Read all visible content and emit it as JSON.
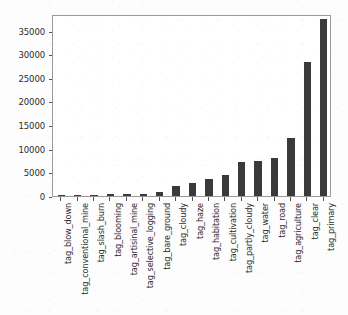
{
  "chart_data": {
    "type": "bar",
    "title": "",
    "xlabel": "",
    "ylabel": "",
    "grid": false,
    "legend": false,
    "bar_color": "#3a3a3a",
    "axis_color": "#9a9a9a",
    "ylim": [
      0,
      38500
    ],
    "yticks": [
      0,
      5000,
      10000,
      15000,
      20000,
      25000,
      30000,
      35000
    ],
    "ytick_labels": [
      "0",
      "5000",
      "10000",
      "15000",
      "20000",
      "25000",
      "30000",
      "35000"
    ],
    "categories": [
      "tag_blow_down",
      "tag_conventional_mine",
      "tag_slash_burn",
      "tag_blooming",
      "tag_artisinal_mine",
      "tag_selective_logging",
      "tag_bare_ground",
      "tag_cloudy",
      "tag_haze",
      "tag_habitation",
      "tag_cultivation",
      "tag_partly_cloudy",
      "tag_water",
      "tag_road",
      "tag_agriculture",
      "tag_clear",
      "tag_primary"
    ],
    "values": [
      98,
      100,
      209,
      332,
      339,
      340,
      862,
      2089,
      2697,
      3660,
      4547,
      7261,
      7411,
      8071,
      12315,
      28431,
      37513
    ]
  }
}
